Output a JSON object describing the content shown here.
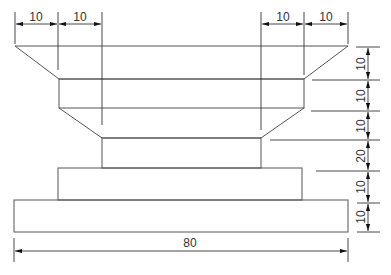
{
  "drawing": {
    "title": "",
    "stroke_color": "#555555",
    "text_color": "#333333",
    "background": "#ffffff"
  },
  "dimensions": {
    "top": [
      {
        "label": "10",
        "from_x": 15,
        "to_x": 58
      },
      {
        "label": "10",
        "from_x": 58,
        "to_x": 102
      },
      {
        "label": "10",
        "from_x": 261,
        "to_x": 304
      },
      {
        "label": "10",
        "from_x": 304,
        "to_x": 348
      }
    ],
    "right": [
      {
        "label": "10",
        "from_y": 46,
        "to_y": 79
      },
      {
        "label": "10",
        "from_y": 79,
        "to_y": 108
      },
      {
        "label": "10",
        "from_y": 108,
        "to_y": 138
      },
      {
        "label": "20",
        "from_y": 138,
        "to_y": 168
      },
      {
        "label": "10",
        "from_y": 168,
        "to_y": 200
      },
      {
        "label": "10",
        "from_y": 200,
        "to_y": 232
      }
    ],
    "bottom": {
      "label": "80",
      "from_x": 14,
      "to_x": 348
    }
  },
  "bottom_caption": ""
}
